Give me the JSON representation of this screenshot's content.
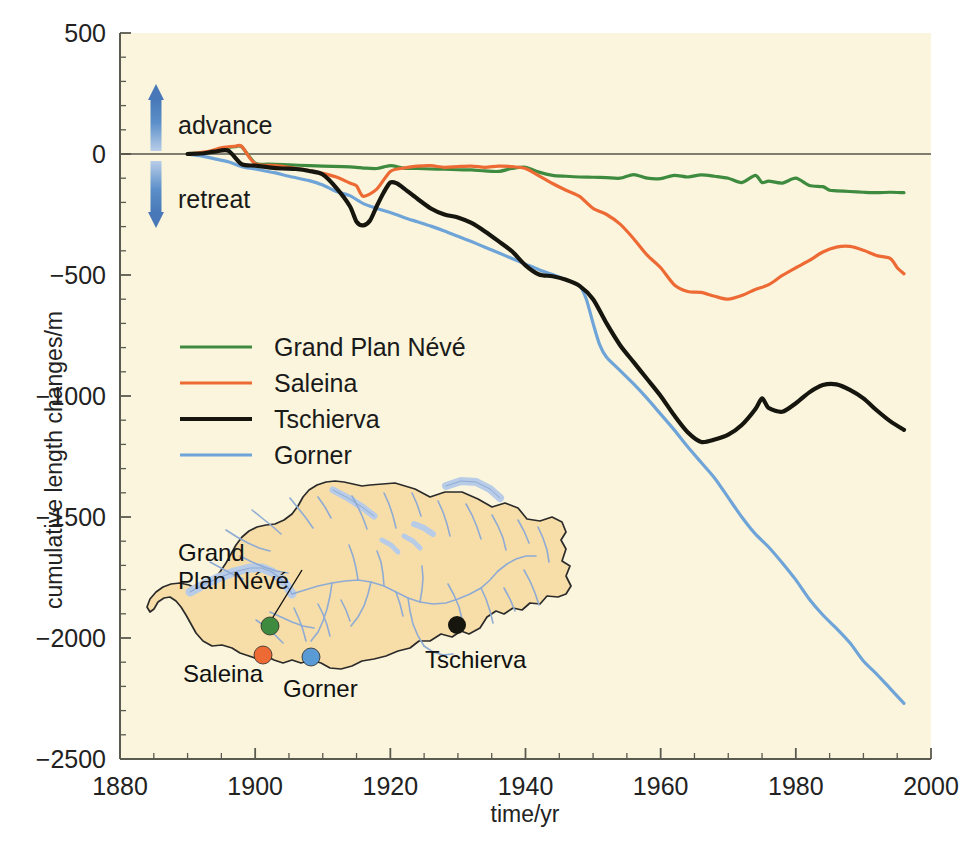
{
  "chart_data": {
    "type": "line",
    "title": "",
    "xlabel": "time/yr",
    "ylabel": "cumulative length changes/m",
    "xlim": [
      1880,
      2000
    ],
    "ylim": [
      -2500,
      500
    ],
    "xticks": [
      1880,
      1900,
      1920,
      1940,
      1960,
      1980,
      2000
    ],
    "yticks": [
      500,
      0,
      -500,
      -1000,
      -1500,
      -2000,
      -2500
    ],
    "xtick_labels": [
      "1880",
      "1900",
      "1920",
      "1940",
      "1960",
      "1980",
      "2000"
    ],
    "ytick_labels": [
      "500",
      "0",
      "−500",
      "−1000",
      "−1500",
      "−2000",
      "−2500"
    ],
    "x_minor_step": 5,
    "y_minor_step": 100,
    "grid": false,
    "legend_position": "center-left",
    "zero_line": 0,
    "annotations": [
      {
        "name": "advance",
        "text": "advance",
        "direction": "up"
      },
      {
        "name": "retreat",
        "text": "retreat",
        "direction": "down"
      }
    ],
    "series": [
      {
        "name": "Grand Plan Névé",
        "color": "#3e8b40",
        "x": [
          1890,
          1893,
          1895,
          1897,
          1898,
          1900,
          1902,
          1905,
          1908,
          1910,
          1913,
          1915,
          1916,
          1918,
          1920,
          1922,
          1924,
          1926,
          1928,
          1930,
          1932,
          1934,
          1936,
          1938,
          1940,
          1942,
          1944,
          1946,
          1948,
          1950,
          1952,
          1954,
          1956,
          1958,
          1960,
          1962,
          1964,
          1966,
          1968,
          1970,
          1972,
          1974,
          1975,
          1976,
          1978,
          1980,
          1982,
          1984,
          1985,
          1986,
          1988,
          1990,
          1992,
          1994,
          1996
        ],
        "y": [
          0,
          8,
          22,
          30,
          30,
          -38,
          -42,
          -45,
          -48,
          -50,
          -52,
          -55,
          -58,
          -60,
          -48,
          -58,
          -60,
          -62,
          -63,
          -65,
          -66,
          -70,
          -72,
          -60,
          -55,
          -75,
          -88,
          -92,
          -95,
          -96,
          -98,
          -100,
          -85,
          -100,
          -102,
          -88,
          -95,
          -86,
          -92,
          -100,
          -118,
          -88,
          -118,
          -112,
          -120,
          -100,
          -130,
          -135,
          -150,
          -152,
          -155,
          -158,
          -160,
          -158,
          -160
        ]
      },
      {
        "name": "Saleina",
        "color": "#ee6a35",
        "x": [
          1890,
          1893,
          1895,
          1897,
          1898,
          1900,
          1903,
          1905,
          1908,
          1910,
          1912,
          1914,
          1915,
          1916,
          1918,
          1920,
          1922,
          1924,
          1926,
          1928,
          1930,
          1932,
          1934,
          1936,
          1938,
          1940,
          1942,
          1944,
          1946,
          1948,
          1950,
          1952,
          1954,
          1956,
          1958,
          1960,
          1962,
          1964,
          1966,
          1968,
          1970,
          1972,
          1974,
          1976,
          1978,
          1980,
          1982,
          1984,
          1986,
          1988,
          1990,
          1992,
          1994,
          1995,
          1996
        ],
        "y": [
          0,
          10,
          26,
          32,
          32,
          -40,
          -48,
          -55,
          -68,
          -80,
          -95,
          -120,
          -132,
          -175,
          -145,
          -72,
          -58,
          -50,
          -48,
          -55,
          -52,
          -50,
          -55,
          -50,
          -52,
          -60,
          -90,
          -122,
          -150,
          -175,
          -225,
          -250,
          -290,
          -350,
          -418,
          -470,
          -540,
          -568,
          -572,
          -588,
          -600,
          -585,
          -560,
          -540,
          -502,
          -470,
          -440,
          -405,
          -385,
          -382,
          -398,
          -420,
          -432,
          -470,
          -495
        ]
      },
      {
        "name": "Tschierva",
        "color": "#16160f",
        "x": [
          1890,
          1892,
          1894,
          1896,
          1898,
          1900,
          1902,
          1904,
          1906,
          1908,
          1910,
          1912,
          1914,
          1915,
          1916,
          1917,
          1918,
          1919,
          1920,
          1921,
          1922,
          1924,
          1926,
          1928,
          1930,
          1932,
          1934,
          1936,
          1938,
          1940,
          1942,
          1944,
          1946,
          1948,
          1950,
          1952,
          1954,
          1956,
          1958,
          1960,
          1962,
          1964,
          1966,
          1968,
          1970,
          1972,
          1974,
          1975,
          1976,
          1978,
          1980,
          1982,
          1984,
          1986,
          1988,
          1990,
          1992,
          1994,
          1996
        ],
        "y": [
          0,
          2,
          10,
          14,
          -42,
          -48,
          -55,
          -60,
          -62,
          -70,
          -85,
          -140,
          -215,
          -280,
          -295,
          -275,
          -215,
          -160,
          -118,
          -122,
          -142,
          -185,
          -225,
          -250,
          -262,
          -285,
          -320,
          -360,
          -402,
          -460,
          -498,
          -505,
          -520,
          -545,
          -600,
          -700,
          -790,
          -860,
          -930,
          -1000,
          -1080,
          -1150,
          -1190,
          -1180,
          -1160,
          -1120,
          -1055,
          -1010,
          -1050,
          -1065,
          -1030,
          -985,
          -955,
          -952,
          -975,
          -1010,
          -1060,
          -1105,
          -1140
        ]
      },
      {
        "name": "Gorner",
        "color": "#6fa4d8",
        "x": [
          1890,
          1892,
          1894,
          1896,
          1898,
          1900,
          1903,
          1905,
          1908,
          1910,
          1912,
          1914,
          1916,
          1918,
          1920,
          1922,
          1924,
          1926,
          1928,
          1930,
          1932,
          1934,
          1936,
          1938,
          1940,
          1942,
          1944,
          1946,
          1948,
          1949,
          1950,
          1951,
          1952,
          1954,
          1956,
          1958,
          1960,
          1962,
          1964,
          1966,
          1968,
          1970,
          1972,
          1974,
          1976,
          1978,
          1980,
          1982,
          1984,
          1986,
          1988,
          1990,
          1992,
          1994,
          1996
        ],
        "y": [
          0,
          -8,
          -20,
          -32,
          -52,
          -62,
          -78,
          -92,
          -110,
          -128,
          -155,
          -172,
          -205,
          -225,
          -242,
          -262,
          -280,
          -298,
          -318,
          -340,
          -362,
          -385,
          -408,
          -432,
          -455,
          -478,
          -498,
          -520,
          -545,
          -600,
          -700,
          -790,
          -840,
          -895,
          -950,
          -1010,
          -1075,
          -1140,
          -1210,
          -1275,
          -1340,
          -1420,
          -1500,
          -1570,
          -1625,
          -1690,
          -1760,
          -1840,
          -1905,
          -1960,
          -2020,
          -2095,
          -2150,
          -2210,
          -2270
        ]
      }
    ]
  },
  "legend": {
    "items": [
      {
        "label": "Grand Plan Névé",
        "color": "#3e8b40"
      },
      {
        "label": "Saleina",
        "color": "#ee6a35"
      },
      {
        "label": "Tschierva",
        "color": "#16160f"
      },
      {
        "label": "Gorner",
        "color": "#6fa4d8"
      }
    ]
  },
  "map_inset": {
    "name": "switzerland-map",
    "land_color": "#f7dea8",
    "water_color": "#9fb8dc",
    "outline_color": "#2b2b2b",
    "markers": [
      {
        "label": "Grand\nPlan Névé",
        "line1": "Grand",
        "line2": "Plan Névé",
        "color": "#3e8b40"
      },
      {
        "label": "Saleina",
        "line1": "Saleina",
        "line2": "",
        "color": "#ee6a35"
      },
      {
        "label": "Gorner",
        "line1": "Gorner",
        "line2": "",
        "color": "#5b9bd5"
      },
      {
        "label": "Tschierva",
        "line1": "Tschierva",
        "line2": "",
        "color": "#16160f"
      }
    ]
  },
  "style": {
    "plot_background": "#faf5dc",
    "page_background": "#ffffff",
    "axis_color": "#5a5a50",
    "arrow_color": "#4a7fc1"
  }
}
